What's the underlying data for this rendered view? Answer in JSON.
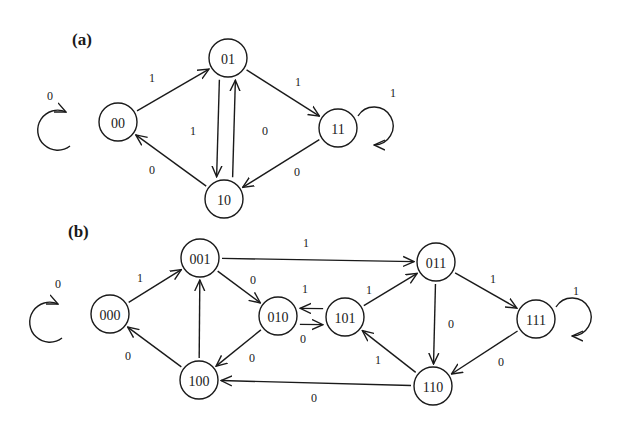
{
  "panels": [
    {
      "label": "(a)",
      "label_pos": [
        72,
        45
      ],
      "nodes": [
        {
          "id": "00",
          "x": 118,
          "y": 122
        },
        {
          "id": "01",
          "x": 228,
          "y": 58
        },
        {
          "id": "11",
          "x": 338,
          "y": 128
        },
        {
          "id": "10",
          "x": 224,
          "y": 199
        }
      ],
      "edges": [
        {
          "from": "00",
          "to": "01",
          "label": "1",
          "lx": 152,
          "ly": 78
        },
        {
          "from": "01",
          "to": "11",
          "label": "1",
          "lx": 298,
          "ly": 82
        },
        {
          "from": "01",
          "to": "10",
          "label": "0",
          "lx": 265,
          "ly": 131
        },
        {
          "from": "10",
          "to": "01",
          "label": "1",
          "lx": 193,
          "ly": 131
        },
        {
          "from": "11",
          "to": "10",
          "label": "0",
          "lx": 297,
          "ly": 172
        },
        {
          "from": "10",
          "to": "00",
          "label": "0",
          "lx": 152,
          "ly": 170
        },
        {
          "from": "00",
          "to": "00",
          "label": "0",
          "self": "left",
          "lx": 50,
          "ly": 96
        },
        {
          "from": "11",
          "to": "11",
          "label": "1",
          "self": "right",
          "lx": 393,
          "ly": 93
        }
      ]
    },
    {
      "label": "(b)",
      "label_pos": [
        68,
        237
      ],
      "nodes": [
        {
          "id": "000",
          "x": 110,
          "y": 314
        },
        {
          "id": "001",
          "x": 200,
          "y": 258
        },
        {
          "id": "010",
          "x": 278,
          "y": 316
        },
        {
          "id": "101",
          "x": 345,
          "y": 317
        },
        {
          "id": "011",
          "x": 436,
          "y": 262
        },
        {
          "id": "111",
          "x": 536,
          "y": 319
        },
        {
          "id": "110",
          "x": 433,
          "y": 386
        },
        {
          "id": "100",
          "x": 199,
          "y": 380
        }
      ],
      "edges": [
        {
          "from": "000",
          "to": "001",
          "label": "1",
          "lx": 140,
          "ly": 278
        },
        {
          "from": "001",
          "to": "011",
          "label": "1",
          "lx": 306,
          "ly": 243
        },
        {
          "from": "001",
          "to": "010",
          "label": "0",
          "lx": 253,
          "ly": 280
        },
        {
          "from": "010",
          "to": "101",
          "label": "1",
          "lx": 305,
          "ly": 289
        },
        {
          "from": "101",
          "to": "010",
          "label": "0",
          "lx": 303,
          "ly": 339
        },
        {
          "from": "101",
          "to": "011",
          "label": "1",
          "lx": 369,
          "ly": 290
        },
        {
          "from": "011",
          "to": "110",
          "label": "0",
          "lx": 451,
          "ly": 324
        },
        {
          "from": "011",
          "to": "111",
          "label": "1",
          "lx": 493,
          "ly": 279
        },
        {
          "from": "111",
          "to": "110",
          "label": "0",
          "lx": 501,
          "ly": 362
        },
        {
          "from": "110",
          "to": "101",
          "label": "1",
          "lx": 378,
          "ly": 360
        },
        {
          "from": "110",
          "to": "100",
          "label": "0",
          "lx": 314,
          "ly": 398
        },
        {
          "from": "100",
          "to": "001",
          "label": "",
          "lx": 0,
          "ly": 0
        },
        {
          "from": "010",
          "to": "100",
          "label": "0",
          "lx": 252,
          "ly": 358
        },
        {
          "from": "100",
          "to": "000",
          "label": "0",
          "lx": 128,
          "ly": 356
        },
        {
          "from": "000",
          "to": "000",
          "label": "0",
          "self": "left",
          "lx": 58,
          "ly": 284
        },
        {
          "from": "111",
          "to": "111",
          "label": "1",
          "self": "right",
          "lx": 576,
          "ly": 291
        }
      ]
    }
  ],
  "style": {
    "stroke": "#1a1a1a",
    "background": "#ffffff",
    "node_radius": 19
  }
}
